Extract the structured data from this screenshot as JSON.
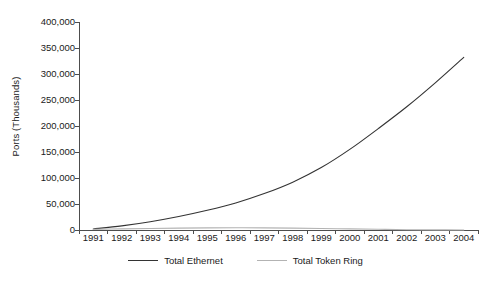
{
  "chart_data": {
    "type": "line",
    "title": "",
    "xlabel": "",
    "ylabel": "Ports (Thousands)",
    "x": [
      1991,
      1992,
      1993,
      1994,
      1995,
      1996,
      1997,
      1998,
      1999,
      2000,
      2001,
      2002,
      2003,
      2004
    ],
    "categories": [
      "1991",
      "1992",
      "1993",
      "1994",
      "1995",
      "1996",
      "1997",
      "1998",
      "1999",
      "2000",
      "2001",
      "2002",
      "2003",
      "2004"
    ],
    "series": [
      {
        "name": "Total Ethernet",
        "color": "#333333",
        "values": [
          2000,
          8000,
          16000,
          26000,
          38000,
          52000,
          70000,
          92000,
          120000,
          155000,
          195000,
          237000,
          283000,
          332000
        ]
      },
      {
        "name": "Total Token Ring",
        "color": "#b3b3b3",
        "values": [
          1200,
          2200,
          3000,
          3600,
          4000,
          4200,
          4100,
          3700,
          3000,
          2100,
          1300,
          600,
          250,
          100
        ]
      }
    ],
    "ylim": [
      0,
      400000
    ],
    "y_ticks": [
      0,
      50000,
      100000,
      150000,
      200000,
      250000,
      300000,
      350000,
      400000
    ],
    "y_tick_labels": [
      "0",
      "50,000",
      "100,000",
      "150,000",
      "200,000",
      "250,000",
      "300,000",
      "350,000",
      "400,000"
    ],
    "grid": false,
    "legend_position": "bottom",
    "axis_color": "#4d4d4d"
  },
  "legend": {
    "items": [
      {
        "label": "Total Ethernet"
      },
      {
        "label": "Total Token Ring"
      }
    ]
  }
}
